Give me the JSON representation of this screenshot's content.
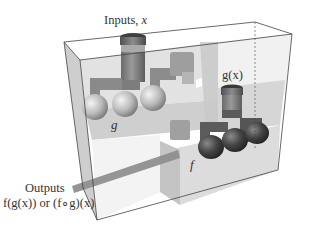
{
  "diagram": {
    "labels": {
      "inputs": "Inputs, x",
      "inputs_prefix": "Inputs, ",
      "inputs_var": "x",
      "gx": "g(x)",
      "g": "g",
      "f": "f",
      "outputs": "Outputs",
      "outputs_expr": "f(g(x)) or (f∘g)(x)"
    },
    "components": [
      {
        "name": "outer-box",
        "description": "transparent 3D box containing both machines"
      },
      {
        "name": "machine-g",
        "description": "upper machine with input funnel, pipes and three light spheres",
        "label": "g"
      },
      {
        "name": "machine-f",
        "description": "lower-right machine with funnel receiving g(x) and three dark spheres",
        "label": "f"
      },
      {
        "name": "output-chute",
        "description": "bar exiting the box toward the lower left"
      }
    ],
    "colors": {
      "box_edge": "#444444",
      "panel_light": "#d9d9d9",
      "panel_mid": "#bdbdbd",
      "pipe": "#8a8a8a",
      "sphere_light": "#cfcfcf",
      "sphere_dark": "#3a3a3a"
    }
  }
}
